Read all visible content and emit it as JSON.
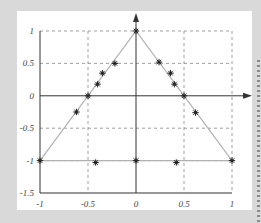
{
  "chart_data": {
    "type": "line",
    "title": "",
    "xlabel": "",
    "ylabel": "",
    "xlim": [
      -1,
      1
    ],
    "ylim": [
      -1.5,
      1
    ],
    "grid": true,
    "grid_style": "dashed",
    "legend": null,
    "x_ticks": [
      "-1",
      "-0.5",
      "0",
      "0.5",
      "1"
    ],
    "y_ticks": [
      "1",
      "0.5",
      "0",
      "-0.5",
      "-1",
      "-1.5"
    ],
    "series": [
      {
        "name": "triangle boundary",
        "style": "line",
        "color": "#b0b0b0",
        "x": [
          -1,
          0,
          1,
          -1
        ],
        "y": [
          -1,
          1,
          -1,
          -1
        ]
      },
      {
        "name": "nodes",
        "style": "asterisk-markers",
        "color": "#222222",
        "x": [
          -1,
          -0.62,
          -0.5,
          -0.4,
          -0.35,
          -0.22,
          0,
          0.24,
          0.36,
          0.4,
          0.5,
          0.62,
          1,
          -0.42,
          0,
          0.42
        ],
        "y": [
          -1,
          -0.25,
          0,
          0.18,
          0.35,
          0.5,
          1,
          0.52,
          0.35,
          0.18,
          0,
          -0.26,
          -1,
          -1.03,
          -1,
          -1.03
        ]
      }
    ],
    "axes_arrows": {
      "x_axis_at_y": 0,
      "y_axis_at_x": 0
    }
  },
  "colors": {
    "background": "#d9d9d9",
    "panel": "#ffffff",
    "axis": "#333333",
    "grid": "#888888",
    "line": "#b0b0b0",
    "marker": "#222222"
  }
}
